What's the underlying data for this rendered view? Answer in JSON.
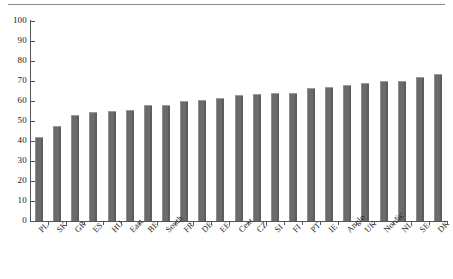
{
  "chart_data": {
    "type": "bar",
    "title": "",
    "subtitle": "",
    "xlabel": "",
    "ylabel": "",
    "ylim": [
      0,
      100
    ],
    "yticks": [
      0,
      10,
      20,
      30,
      40,
      50,
      60,
      70,
      80,
      90,
      100
    ],
    "grid": false,
    "legend": null,
    "bar_color": "#6e6e6e",
    "orientation": "vertical",
    "sorted": "ascending",
    "categories": [
      "PL",
      "SK",
      "GR",
      "ES",
      "HU",
      "East",
      "BE",
      "South",
      "FR",
      "DE",
      "EE",
      "Cent",
      "CZ",
      "SI",
      "FI",
      "PT",
      "IE",
      "Anglo",
      "UK",
      "Nordic",
      "NL",
      "SE",
      "DK"
    ],
    "values": [
      41.8,
      47.6,
      53.2,
      54.6,
      55.2,
      55.5,
      57.8,
      58.2,
      59.8,
      60.5,
      61.4,
      62.8,
      63.4,
      63.8,
      64.1,
      66.6,
      67.2,
      68.2,
      69.2,
      69.8,
      69.8,
      71.9,
      73.4
    ],
    "series": [
      {
        "name": "value",
        "values": [
          41.8,
          47.6,
          53.2,
          54.6,
          55.2,
          55.5,
          57.8,
          58.2,
          59.8,
          60.5,
          61.4,
          62.8,
          63.4,
          63.8,
          64.1,
          66.6,
          67.2,
          68.2,
          69.2,
          69.8,
          69.8,
          71.9,
          73.4
        ]
      }
    ]
  }
}
